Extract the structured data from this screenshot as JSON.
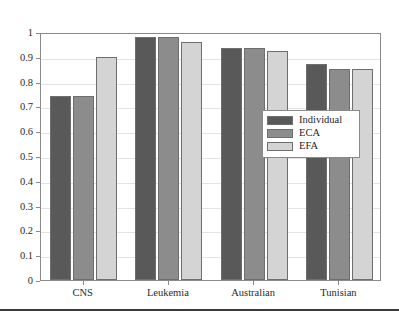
{
  "chart_data": {
    "type": "bar",
    "title": "",
    "subtitle": "",
    "xlabel": "",
    "ylabel": "",
    "categories": [
      "CNS",
      "Leukemia",
      "Australian",
      "Tunisian"
    ],
    "series": [
      {
        "name": "Individual",
        "color": "#595959",
        "values": [
          0.74,
          0.98,
          0.935,
          0.87
        ]
      },
      {
        "name": "ECA",
        "color": "#8c8c8c",
        "values": [
          0.74,
          0.98,
          0.935,
          0.85
        ]
      },
      {
        "name": "EFA",
        "color": "#d4d4d4",
        "values": [
          0.9,
          0.96,
          0.925,
          0.85
        ]
      }
    ],
    "ylim": [
      0,
      1
    ],
    "yticks": [
      0,
      0.1,
      0.2,
      0.3,
      0.4,
      0.5,
      0.6,
      0.7,
      0.8,
      0.9,
      1
    ],
    "ytick_labels": [
      "0",
      "0.1",
      "0.2",
      "0.3",
      "0.4",
      "0.5",
      "0.6",
      "0.7",
      "0.8",
      "0.9",
      "1"
    ],
    "grid": true,
    "grid_axis": "y",
    "legend_position": "center-right",
    "legend_entries": [
      "Individual",
      "ECA",
      "EFA"
    ],
    "bar_edge_color": "#6e6e6e",
    "axis_color": "#8a8a8a",
    "grid_color": "#e3e3e3",
    "background_color": "#ffffff"
  },
  "figure": {
    "bottom_rule_color": "#3a3a3a"
  }
}
